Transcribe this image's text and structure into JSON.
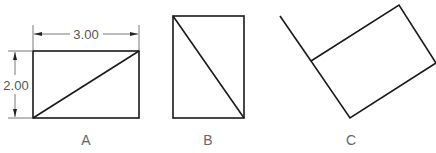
{
  "figures": [
    {
      "id": "A",
      "label": "A",
      "description": "3.00 x 2.00 rectangle with diagonal from bottom-left to top-right, dimensioned"
    },
    {
      "id": "B",
      "label": "B",
      "description": "rectangle rotated 90 degrees (portrait) with diagonal from top-left to bottom-right"
    },
    {
      "id": "C",
      "label": "C",
      "description": "rectangle rotated at an angle with extended edge line"
    }
  ],
  "dimensions": {
    "width": "3.00",
    "height": "2.00"
  },
  "colors": {
    "line": "#1a1a1a",
    "dimension": "#555555",
    "label": "#666666"
  }
}
